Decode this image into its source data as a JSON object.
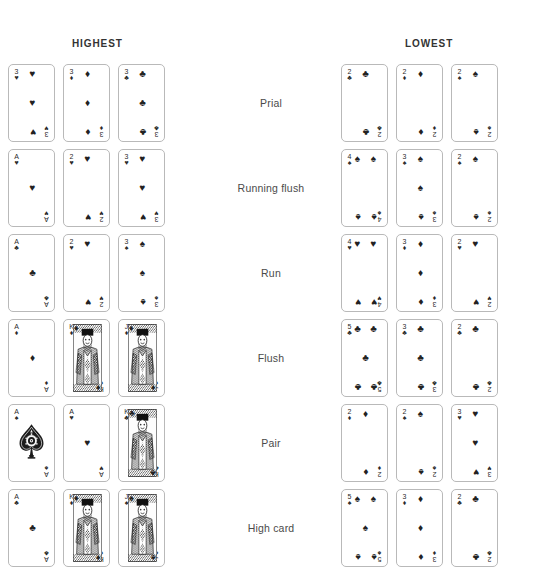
{
  "headers": {
    "highest": "HIGHEST",
    "lowest": "LOWEST"
  },
  "suit_glyphs": {
    "spade": "♠",
    "heart": "♥",
    "diamond": "♦",
    "club": "♣"
  },
  "colors": {
    "ink": "#222222",
    "card_border": "#b9b9b9",
    "label_text": "#4a4a4a",
    "header_text": "#333333",
    "background": "#ffffff"
  },
  "rows": [
    {
      "label": "Prial",
      "highest": [
        {
          "rank": "3",
          "suit": "heart",
          "face": false
        },
        {
          "rank": "3",
          "suit": "diamond",
          "face": false
        },
        {
          "rank": "3",
          "suit": "club",
          "face": false
        }
      ],
      "lowest": [
        {
          "rank": "2",
          "suit": "club",
          "face": false
        },
        {
          "rank": "2",
          "suit": "diamond",
          "face": false
        },
        {
          "rank": "2",
          "suit": "spade",
          "face": false
        }
      ]
    },
    {
      "label": "Running flush",
      "highest": [
        {
          "rank": "A",
          "suit": "heart",
          "face": false
        },
        {
          "rank": "2",
          "suit": "heart",
          "face": false
        },
        {
          "rank": "3",
          "suit": "heart",
          "face": false
        }
      ],
      "lowest": [
        {
          "rank": "4",
          "suit": "spade",
          "face": false
        },
        {
          "rank": "3",
          "suit": "spade",
          "face": false
        },
        {
          "rank": "2",
          "suit": "spade",
          "face": false
        }
      ]
    },
    {
      "label": "Run",
      "highest": [
        {
          "rank": "A",
          "suit": "club",
          "face": false
        },
        {
          "rank": "2",
          "suit": "heart",
          "face": false
        },
        {
          "rank": "3",
          "suit": "spade",
          "face": false
        }
      ],
      "lowest": [
        {
          "rank": "4",
          "suit": "heart",
          "face": false
        },
        {
          "rank": "3",
          "suit": "diamond",
          "face": false
        },
        {
          "rank": "2",
          "suit": "heart",
          "face": false
        }
      ]
    },
    {
      "label": "Flush",
      "highest": [
        {
          "rank": "A",
          "suit": "diamond",
          "face": false
        },
        {
          "rank": "K",
          "suit": "diamond",
          "face": true
        },
        {
          "rank": "J",
          "suit": "diamond",
          "face": true
        }
      ],
      "lowest": [
        {
          "rank": "5",
          "suit": "club",
          "face": false
        },
        {
          "rank": "3",
          "suit": "club",
          "face": false
        },
        {
          "rank": "2",
          "suit": "club",
          "face": false
        }
      ]
    },
    {
      "label": "Pair",
      "highest": [
        {
          "rank": "A",
          "suit": "spade",
          "face": false,
          "ornate_ace": true
        },
        {
          "rank": "A",
          "suit": "heart",
          "face": false
        },
        {
          "rank": "K",
          "suit": "club",
          "face": true
        }
      ],
      "lowest": [
        {
          "rank": "2",
          "suit": "diamond",
          "face": false
        },
        {
          "rank": "2",
          "suit": "spade",
          "face": false
        },
        {
          "rank": "3",
          "suit": "heart",
          "face": false
        }
      ]
    },
    {
      "label": "High card",
      "highest": [
        {
          "rank": "A",
          "suit": "club",
          "face": false
        },
        {
          "rank": "K",
          "suit": "diamond",
          "face": true
        },
        {
          "rank": "J",
          "suit": "spade",
          "face": true
        }
      ],
      "lowest": [
        {
          "rank": "5",
          "suit": "spade",
          "face": false
        },
        {
          "rank": "3",
          "suit": "diamond",
          "face": false
        },
        {
          "rank": "2",
          "suit": "club",
          "face": false
        }
      ]
    }
  ]
}
